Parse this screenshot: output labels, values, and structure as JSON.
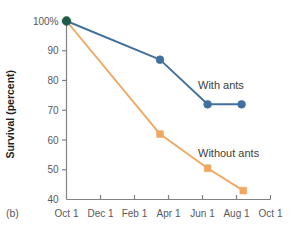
{
  "panel": {
    "label": "(b)"
  },
  "colors": {
    "with_ants": "#41709f",
    "without_ants": "#f0a860",
    "origin_marker": "#1f5b4a",
    "axis": "#808285",
    "tick_text": "#58595b",
    "axis_title": "#231f20",
    "background": "#ffffff"
  },
  "chart_data": {
    "type": "line",
    "title": "",
    "xlabel": "",
    "ylabel": "Survival (percent)",
    "x": [
      "Oct 1",
      "Dec 1",
      "Feb 1",
      "Apr 1",
      "Jun 1",
      "Aug 1",
      "Oct 1"
    ],
    "xtick_labels": [
      "Oct 1",
      "Dec 1",
      "Feb 1",
      "Apr 1",
      "Jun 1",
      "Aug 1",
      "Oct 1"
    ],
    "ytick_labels": [
      "100%",
      "90",
      "80",
      "70",
      "60",
      "50",
      "40"
    ],
    "ytick_values": [
      100,
      90,
      80,
      70,
      60,
      50,
      40
    ],
    "ylim": [
      40,
      100
    ],
    "xlim": [
      0,
      6
    ],
    "grid": false,
    "legend_position": "inline-annotations",
    "series": [
      {
        "name": "With ants",
        "color": "#41709f",
        "marker": "circle",
        "points": [
          {
            "x": 0,
            "x_label": "Oct 1",
            "y": 100
          },
          {
            "x": 2.75,
            "x_label": "mid-Mar",
            "y": 87
          },
          {
            "x": 4.15,
            "x_label": "early Jun",
            "y": 72
          },
          {
            "x": 5.15,
            "x_label": "early Aug",
            "y": 72
          }
        ]
      },
      {
        "name": "Without ants",
        "color": "#f0a860",
        "marker": "square",
        "points": [
          {
            "x": 0,
            "x_label": "Oct 1",
            "y": 100
          },
          {
            "x": 2.75,
            "x_label": "mid-Mar",
            "y": 62
          },
          {
            "x": 4.15,
            "x_label": "early Jun",
            "y": 50.5
          },
          {
            "x": 5.2,
            "x_label": "early Aug",
            "y": 43
          }
        ]
      }
    ],
    "annotations": [
      {
        "text": "With ants",
        "series": "With ants"
      },
      {
        "text": "Without ants",
        "series": "Without ants"
      }
    ]
  }
}
